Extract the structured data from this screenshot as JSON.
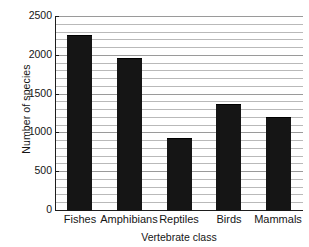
{
  "chart_data": {
    "type": "bar",
    "title": "",
    "xlabel": "Vertebrate class",
    "ylabel": "Number of species",
    "categories": [
      "Fishes",
      "Amphibians",
      "Reptiles",
      "Birds",
      "Mammals"
    ],
    "values": [
      2250,
      1960,
      930,
      1370,
      1200
    ],
    "ylim": [
      0,
      2500
    ],
    "ytick_labels": [
      "0",
      "500",
      "1000",
      "1500",
      "2000",
      "2500"
    ],
    "ytick_values": [
      0,
      500,
      1000,
      1500,
      2000,
      2500
    ],
    "minor_gridline_step": 100,
    "grid": "horizontal",
    "legend": "none",
    "bar_color": "#151515",
    "background_color": "#ffffff",
    "gridline_color": "#b9b9b9",
    "axis_color": "#1d1d1d"
  }
}
